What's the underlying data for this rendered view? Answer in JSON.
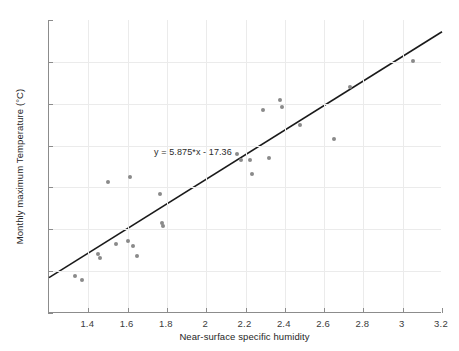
{
  "chart_data": {
    "type": "scatter",
    "title": "",
    "xlabel": "Near-surface specific humidity",
    "ylabel": "Monthly maximum Temperature (°C)",
    "xlim": [
      1.2,
      3.2
    ],
    "ylim": [
      -12,
      2
    ],
    "xticks": [
      1.4,
      1.6,
      1.8,
      2,
      2.2,
      2.4,
      2.6,
      2.8,
      3,
      3.2
    ],
    "xticklabels": [
      "1.4",
      "1.6",
      "1.8",
      "2",
      "2.2",
      "2.4",
      "2.6",
      "2.8",
      "3",
      "3.2"
    ],
    "yticks": [
      2,
      0,
      -2,
      -4,
      -6,
      -8,
      -10,
      -12
    ],
    "yticklabels": [
      "2",
      "0",
      "-2",
      "-4",
      "-6",
      "-8",
      "-10",
      "-12"
    ],
    "grid": true,
    "legend": null,
    "marker_color": "#8a8a8a",
    "line_color": "#1a1a1a",
    "points": [
      {
        "x": 1.33,
        "y": -10.25
      },
      {
        "x": 1.37,
        "y": -10.42
      },
      {
        "x": 1.45,
        "y": -9.18
      },
      {
        "x": 1.46,
        "y": -9.35
      },
      {
        "x": 1.5,
        "y": -5.72
      },
      {
        "x": 1.54,
        "y": -8.68
      },
      {
        "x": 1.6,
        "y": -8.58
      },
      {
        "x": 1.61,
        "y": -5.51
      },
      {
        "x": 1.63,
        "y": -8.78
      },
      {
        "x": 1.65,
        "y": -9.28
      },
      {
        "x": 1.765,
        "y": -6.33
      },
      {
        "x": 1.775,
        "y": -7.72
      },
      {
        "x": 1.78,
        "y": -7.82
      },
      {
        "x": 2.155,
        "y": -4.42
      },
      {
        "x": 2.175,
        "y": -4.68
      },
      {
        "x": 2.225,
        "y": -4.7
      },
      {
        "x": 2.235,
        "y": -5.35
      },
      {
        "x": 2.29,
        "y": -2.28
      },
      {
        "x": 2.32,
        "y": -4.58
      },
      {
        "x": 2.375,
        "y": -1.8
      },
      {
        "x": 2.385,
        "y": -2.15
      },
      {
        "x": 2.475,
        "y": -3.02
      },
      {
        "x": 2.65,
        "y": -3.67
      },
      {
        "x": 2.73,
        "y": -1.2
      },
      {
        "x": 3.05,
        "y": 0.05
      }
    ],
    "fit_line": {
      "slope": 5.875,
      "intercept": -17.36,
      "equation": "y = 5.875*x - 17.36",
      "x_start": 1.2,
      "x_end": 3.2,
      "y_start": -10.31,
      "y_end": 1.44
    },
    "annotation": {
      "text": "y = 5.875*x - 17.36",
      "x": 1.74,
      "y": -4.35
    }
  }
}
